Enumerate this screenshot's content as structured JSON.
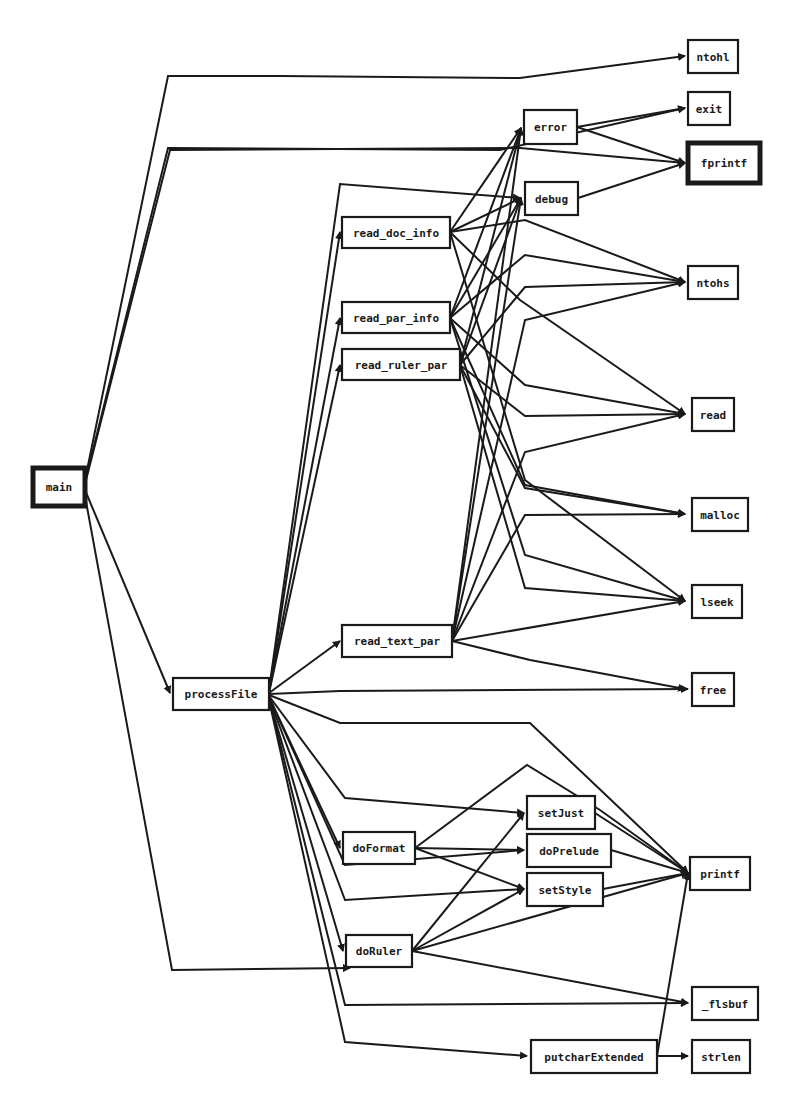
{
  "diagram": {
    "type": "call-graph",
    "nodes": [
      {
        "id": "main",
        "label": "main",
        "x": 33,
        "y": 468,
        "w": 52,
        "h": 38,
        "bold": true
      },
      {
        "id": "processFile",
        "label": "processFile",
        "x": 173,
        "y": 678,
        "w": 96,
        "h": 32
      },
      {
        "id": "read_doc_info",
        "label": "read_doc_info",
        "x": 342,
        "y": 217,
        "w": 108,
        "h": 31
      },
      {
        "id": "read_par_info",
        "label": "read_par_info",
        "x": 342,
        "y": 302,
        "w": 108,
        "h": 31
      },
      {
        "id": "read_ruler_par",
        "label": "read_ruler_par",
        "x": 342,
        "y": 349,
        "w": 118,
        "h": 31
      },
      {
        "id": "read_text_par",
        "label": "read_text_par",
        "x": 342,
        "y": 625,
        "w": 110,
        "h": 32
      },
      {
        "id": "doFormat",
        "label": "doFormat",
        "x": 343,
        "y": 832,
        "w": 72,
        "h": 32
      },
      {
        "id": "doRuler",
        "label": "doRuler",
        "x": 346,
        "y": 935,
        "w": 66,
        "h": 32
      },
      {
        "id": "error",
        "label": "error",
        "x": 524,
        "y": 110,
        "w": 53,
        "h": 34
      },
      {
        "id": "debug",
        "label": "debug",
        "x": 525,
        "y": 182,
        "w": 53,
        "h": 33
      },
      {
        "id": "setJust",
        "label": "setJust",
        "x": 527,
        "y": 796,
        "w": 68,
        "h": 33
      },
      {
        "id": "doPrelude",
        "label": "doPrelude",
        "x": 527,
        "y": 834,
        "w": 84,
        "h": 33
      },
      {
        "id": "setStyle",
        "label": "setStyle",
        "x": 527,
        "y": 873,
        "w": 76,
        "h": 33
      },
      {
        "id": "putcharExtended",
        "label": "putcharExtended",
        "x": 531,
        "y": 1040,
        "w": 126,
        "h": 33
      },
      {
        "id": "ntohl",
        "label": "ntohl",
        "x": 688,
        "y": 40,
        "w": 50,
        "h": 33
      },
      {
        "id": "exit",
        "label": "exit",
        "x": 688,
        "y": 92,
        "w": 42,
        "h": 33
      },
      {
        "id": "fprintf",
        "label": "fprintf",
        "x": 688,
        "y": 143,
        "w": 72,
        "h": 40,
        "bold": true
      },
      {
        "id": "ntohs",
        "label": "ntohs",
        "x": 688,
        "y": 266,
        "w": 50,
        "h": 33
      },
      {
        "id": "read",
        "label": "read",
        "x": 692,
        "y": 398,
        "w": 42,
        "h": 33
      },
      {
        "id": "malloc",
        "label": "malloc",
        "x": 692,
        "y": 498,
        "w": 56,
        "h": 33
      },
      {
        "id": "lseek",
        "label": "lseek",
        "x": 692,
        "y": 585,
        "w": 50,
        "h": 33
      },
      {
        "id": "free",
        "label": "free",
        "x": 692,
        "y": 673,
        "w": 42,
        "h": 33
      },
      {
        "id": "printf",
        "label": "printf",
        "x": 690,
        "y": 857,
        "w": 60,
        "h": 33
      },
      {
        "id": "_flsbuf",
        "label": "_flsbuf",
        "x": 692,
        "y": 987,
        "w": 66,
        "h": 33
      },
      {
        "id": "strlen",
        "label": "strlen",
        "x": 692,
        "y": 1040,
        "w": 58,
        "h": 33
      }
    ],
    "edges": [
      {
        "from": "main",
        "to": "ntohl",
        "points": "85,480 168,76 280,76 520,78 685,56"
      },
      {
        "from": "main",
        "to": "exit",
        "points": "85,482 168,148 500,150 685,108"
      },
      {
        "from": "main",
        "to": "fprintf",
        "points": "85,484 170,150 520,148 685,163"
      },
      {
        "from": "main",
        "to": "processFile",
        "points": "85,490 170,693"
      },
      {
        "from": "main",
        "to": "doRuler",
        "points": "85,496 172,970 350,968"
      },
      {
        "from": "processFile",
        "to": "debug",
        "points": "269,690 340,184 520,198"
      },
      {
        "from": "processFile",
        "to": "read_doc_info",
        "points": "269,692 340,232"
      },
      {
        "from": "processFile",
        "to": "read_par_info",
        "points": "269,692 340,318"
      },
      {
        "from": "processFile",
        "to": "read_ruler_par",
        "points": "269,693 340,365"
      },
      {
        "from": "processFile",
        "to": "read_text_par",
        "points": "269,693 340,641"
      },
      {
        "from": "processFile",
        "to": "free",
        "points": "269,694 340,691 688,689"
      },
      {
        "from": "processFile",
        "to": "printf",
        "points": "269,695 340,723 530,723 688,873"
      },
      {
        "from": "processFile",
        "to": "setJust",
        "points": "269,696 345,798 524,813"
      },
      {
        "from": "processFile",
        "to": "doFormat",
        "points": "269,697 340,848"
      },
      {
        "from": "processFile",
        "to": "doPrelude",
        "points": "269,697 345,865 524,850"
      },
      {
        "from": "processFile",
        "to": "setStyle",
        "points": "269,698 345,900 524,889"
      },
      {
        "from": "processFile",
        "to": "doRuler",
        "points": "269,699 343,951"
      },
      {
        "from": "processFile",
        "to": "_flsbuf",
        "points": "269,699 345,1005 688,1003"
      },
      {
        "from": "processFile",
        "to": "putcharExtended",
        "points": "269,700 345,1042 527,1056"
      },
      {
        "from": "read_doc_info",
        "to": "error",
        "points": "450,232 521,128"
      },
      {
        "from": "read_doc_info",
        "to": "debug",
        "points": "450,232 521,198"
      },
      {
        "from": "read_doc_info",
        "to": "ntohs",
        "points": "450,232 525,220 685,282"
      },
      {
        "from": "read_doc_info",
        "to": "read",
        "points": "450,232 520,300 685,414"
      },
      {
        "from": "read_doc_info",
        "to": "lseek",
        "points": "450,232 525,480 685,601"
      },
      {
        "from": "read_par_info",
        "to": "error",
        "points": "450,318 521,128"
      },
      {
        "from": "read_par_info",
        "to": "debug",
        "points": "450,318 521,198"
      },
      {
        "from": "read_par_info",
        "to": "ntohs",
        "points": "450,318 525,255 685,282"
      },
      {
        "from": "read_par_info",
        "to": "read",
        "points": "450,318 525,385 685,414"
      },
      {
        "from": "read_par_info",
        "to": "malloc",
        "points": "450,318 525,485 685,514"
      },
      {
        "from": "read_par_info",
        "to": "lseek",
        "points": "450,318 525,555 685,601"
      },
      {
        "from": "read_ruler_par",
        "to": "error",
        "points": "460,365 521,128"
      },
      {
        "from": "read_ruler_par",
        "to": "debug",
        "points": "460,365 521,198"
      },
      {
        "from": "read_ruler_par",
        "to": "ntohs",
        "points": "460,365 525,287 685,282"
      },
      {
        "from": "read_ruler_par",
        "to": "read",
        "points": "460,365 525,416 685,414"
      },
      {
        "from": "read_ruler_par",
        "to": "malloc",
        "points": "460,365 525,488 685,514"
      },
      {
        "from": "read_ruler_par",
        "to": "lseek",
        "points": "460,365 525,588 685,601"
      },
      {
        "from": "read_text_par",
        "to": "error",
        "points": "452,641 521,128"
      },
      {
        "from": "read_text_par",
        "to": "debug",
        "points": "452,641 521,198"
      },
      {
        "from": "read_text_par",
        "to": "ntohs",
        "points": "452,641 525,320 685,282"
      },
      {
        "from": "read_text_par",
        "to": "read",
        "points": "452,641 525,452 685,414"
      },
      {
        "from": "read_text_par",
        "to": "malloc",
        "points": "452,641 525,515 685,514"
      },
      {
        "from": "read_text_par",
        "to": "lseek",
        "points": "452,641 685,601"
      },
      {
        "from": "read_text_par",
        "to": "free",
        "points": "452,641 530,660 685,689"
      },
      {
        "from": "error",
        "to": "exit",
        "points": "577,127 685,108"
      },
      {
        "from": "error",
        "to": "fprintf",
        "points": "577,127 685,163"
      },
      {
        "from": "debug",
        "to": "fprintf",
        "points": "578,198 685,163"
      },
      {
        "from": "doFormat",
        "to": "setJust",
        "points": "415,848 527,765 600,810 688,873"
      },
      {
        "from": "doFormat",
        "to": "doPrelude",
        "points": "415,848 524,850"
      },
      {
        "from": "doFormat",
        "to": "setStyle",
        "points": "415,848 524,889"
      },
      {
        "from": "doRuler",
        "to": "setJust",
        "points": "412,951 524,813"
      },
      {
        "from": "doRuler",
        "to": "setStyle",
        "points": "412,951 524,889"
      },
      {
        "from": "doRuler",
        "to": "printf",
        "points": "412,951 688,873"
      },
      {
        "from": "doRuler",
        "to": "_flsbuf",
        "points": "412,951 688,1003"
      },
      {
        "from": "setJust",
        "to": "printf",
        "points": "595,813 688,873"
      },
      {
        "from": "doPrelude",
        "to": "printf",
        "points": "611,850 688,873"
      },
      {
        "from": "setStyle",
        "to": "printf",
        "points": "603,889 688,873"
      },
      {
        "from": "putcharExtended",
        "to": "printf",
        "points": "657,1056 688,873"
      },
      {
        "from": "putcharExtended",
        "to": "strlen",
        "points": "657,1056 688,1056"
      }
    ]
  }
}
